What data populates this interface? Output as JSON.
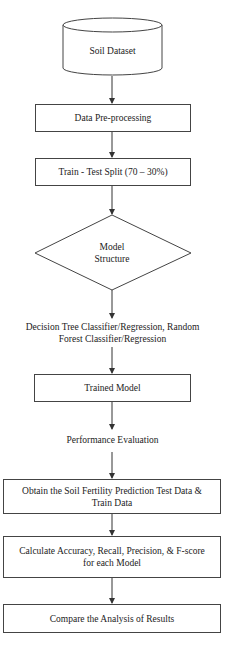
{
  "flowchart": {
    "nodes": [
      {
        "id": "soil-dataset",
        "shape": "cylinder",
        "label": "Soil Dataset"
      },
      {
        "id": "data-preprocessing",
        "shape": "rectangle",
        "label": "Data Pre-processing"
      },
      {
        "id": "train-test-split",
        "shape": "rectangle",
        "label": "Train - Test Split (70 – 30%)"
      },
      {
        "id": "model-structure",
        "shape": "diamond",
        "label_line1": "Model",
        "label_line2": "Structure"
      },
      {
        "id": "algorithms",
        "shape": "text",
        "label_line1": "Decision Tree Classifier/Regression, Random",
        "label_line2": "Forest Classifier/Regression"
      },
      {
        "id": "trained-model",
        "shape": "rectangle",
        "label": "Trained Model"
      },
      {
        "id": "performance-evaluation",
        "shape": "text",
        "label": "Performance Evaluation"
      },
      {
        "id": "obtain-prediction",
        "shape": "rectangle",
        "label_line1": "Obtain the Soil Fertility Prediction Test Data &",
        "label_line2": "Train Data"
      },
      {
        "id": "calculate-metrics",
        "shape": "rectangle",
        "label_line1": "Calculate Accuracy, Recall, Precision, & F-score",
        "label_line2": "for each Model"
      },
      {
        "id": "compare-results",
        "shape": "rectangle",
        "label": "Compare the Analysis of Results"
      }
    ],
    "edges": [
      [
        "soil-dataset",
        "data-preprocessing"
      ],
      [
        "data-preprocessing",
        "train-test-split"
      ],
      [
        "train-test-split",
        "model-structure"
      ],
      [
        "model-structure",
        "algorithms"
      ],
      [
        "algorithms",
        "trained-model"
      ],
      [
        "trained-model",
        "performance-evaluation"
      ],
      [
        "performance-evaluation",
        "obtain-prediction"
      ],
      [
        "obtain-prediction",
        "calculate-metrics"
      ],
      [
        "calculate-metrics",
        "compare-results"
      ]
    ],
    "colors": {
      "stroke": "#444444",
      "text": "#222222",
      "background": "#ffffff"
    }
  }
}
